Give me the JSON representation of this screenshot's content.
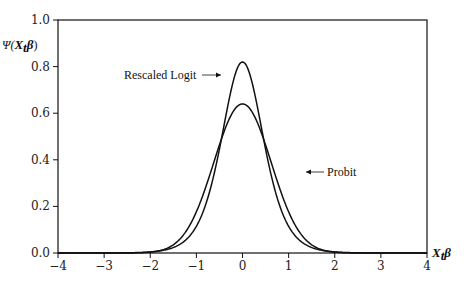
{
  "chart_data": {
    "type": "line",
    "title": "",
    "xlabel": "X_t β",
    "ylabel": "Ψ(X_t β)",
    "xlim": [
      -4,
      4
    ],
    "ylim": [
      0,
      1.0
    ],
    "x_ticks": [
      "−4",
      "−3",
      "−2",
      "−1",
      "0",
      "1",
      "2",
      "3",
      "4"
    ],
    "y_ticks": [
      "0.0",
      "0.2",
      "0.4",
      "0.6",
      "0.8",
      "1.0"
    ],
    "grid": false,
    "legend": "annotations",
    "series": [
      {
        "name": "Rescaled Logit",
        "peak": 0.82,
        "x": [
          -4,
          -3,
          -2,
          -1,
          -0.5,
          0,
          0.5,
          1,
          2,
          3,
          4
        ],
        "values": [
          0.002,
          0.016,
          0.11,
          0.4,
          0.65,
          0.82,
          0.65,
          0.4,
          0.11,
          0.016,
          0.002
        ]
      },
      {
        "name": "Probit",
        "peak": 0.64,
        "x": [
          -4,
          -3,
          -2,
          -1,
          -0.5,
          0,
          0.5,
          1,
          2,
          3,
          4
        ],
        "values": [
          0.0,
          0.006,
          0.04,
          0.29,
          0.46,
          0.64,
          0.46,
          0.29,
          0.04,
          0.006,
          0.0
        ]
      }
    ],
    "annotations": [
      {
        "text": "Rescaled Logit",
        "arrow": "right"
      },
      {
        "text": "Probit",
        "arrow": "left"
      }
    ]
  },
  "labels": {
    "ylabel_psi": "Ψ(",
    "ylabel_x": "X",
    "ylabel_t": "t",
    "ylabel_beta": "β",
    "ylabel_close": ")",
    "xlabel_x": "X",
    "xlabel_t": "t",
    "xlabel_beta": "β",
    "logit": "Rescaled Logit",
    "probit": "Probit"
  }
}
